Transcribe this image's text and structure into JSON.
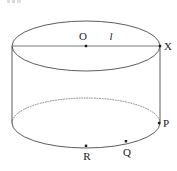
{
  "figure": {
    "kind": "cylinder-diagram",
    "width": 177,
    "height": 171,
    "background_color": "#ffffff",
    "stroke_color": "#4a4a4a",
    "axis_line_color": "#6b6b6b",
    "point_color": "#1a1a1a",
    "label_color": "#1a1a1a"
  },
  "geometry": {
    "top_ellipse": {
      "cx": 86,
      "cy": 46,
      "rx": 74,
      "ry": 25
    },
    "bottom_ellipse": {
      "cx": 86,
      "cy": 123,
      "rx": 74,
      "ry": 25
    },
    "left_side": {
      "x": 12,
      "y1": 46,
      "y2": 123
    },
    "right_side": {
      "x": 160,
      "y1": 46,
      "y2": 123
    },
    "axis_line": {
      "x1": 12,
      "y1": 46,
      "x2": 160,
      "y2": 46
    }
  },
  "points": [
    {
      "id": "O",
      "label": "O",
      "x": 86,
      "y": 46,
      "label_x": 83,
      "label_y": 40,
      "style": "upright"
    },
    {
      "id": "X",
      "label": "X",
      "x": 160,
      "y": 46,
      "label_x": 164,
      "label_y": 49,
      "style": "upright"
    },
    {
      "id": "P",
      "label": "P",
      "x": 159,
      "y": 123,
      "label_x": 163,
      "label_y": 126,
      "style": "upright"
    },
    {
      "id": "Q",
      "label": "Q",
      "x": 126,
      "y": 141,
      "label_x": 123,
      "label_y": 156,
      "style": "upright"
    },
    {
      "id": "R",
      "label": "R",
      "x": 86,
      "y": 146,
      "label_x": 82,
      "label_y": 160,
      "style": "upright"
    }
  ],
  "annotations": [
    {
      "id": "l",
      "label": "l",
      "label_x": 111,
      "label_y": 40,
      "style": "italic",
      "meaning": "slant-or-radius-label"
    }
  ],
  "strokes": {
    "solid_width": 0.9,
    "dotted_width": 0.9,
    "dash_pattern": "1,1.6"
  }
}
